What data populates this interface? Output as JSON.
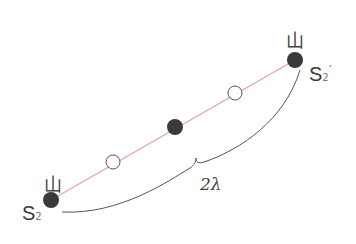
{
  "diagram": {
    "colors": {
      "line": "#e8a0a0",
      "filled": "#3a3a3a",
      "open_stroke": "#555555",
      "brace": "#555555"
    },
    "left_source": {
      "label": "S",
      "subscript": "2",
      "prime": "",
      "crest_symbol": "山"
    },
    "right_source": {
      "label": "S",
      "subscript": "2",
      "prime": "′",
      "crest_symbol": "山"
    },
    "span_label": "2λ",
    "points": [
      {
        "type": "filled",
        "x": 51,
        "y": 200
      },
      {
        "type": "open",
        "x": 113,
        "y": 162
      },
      {
        "type": "filled",
        "x": 175,
        "y": 127
      },
      {
        "type": "open",
        "x": 235,
        "y": 93
      },
      {
        "type": "filled",
        "x": 295,
        "y": 60
      }
    ]
  }
}
